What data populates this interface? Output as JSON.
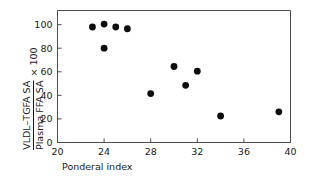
{
  "chart_data": {
    "type": "scatter",
    "title": "",
    "xlabel": "Ponderal index",
    "ylabel_numerator": "VLDL–TGFA SA",
    "ylabel_denominator": "Plasma FFA SA",
    "ylabel_suffix": "× 100",
    "xlim": [
      20,
      40
    ],
    "ylim": [
      0,
      112
    ],
    "xticks": [
      20,
      24,
      28,
      32,
      36,
      40
    ],
    "yticks": [
      0,
      20,
      40,
      60,
      80,
      100
    ],
    "xticklabels": [
      "20",
      "24",
      "28",
      "32",
      "36",
      "40"
    ],
    "yticklabels": [
      "0",
      "20",
      "40",
      "60",
      "80",
      "100"
    ],
    "grid": false,
    "legend": false,
    "marker_color": "#0d0d0d",
    "axis_color": "#4a4a4a",
    "points": [
      {
        "x": 23.0,
        "y": 98.0
      },
      {
        "x": 24.0,
        "y": 100.5
      },
      {
        "x": 25.0,
        "y": 98.0
      },
      {
        "x": 26.0,
        "y": 96.5
      },
      {
        "x": 24.0,
        "y": 80.0
      },
      {
        "x": 28.0,
        "y": 41.5
      },
      {
        "x": 30.0,
        "y": 64.5
      },
      {
        "x": 31.0,
        "y": 48.5
      },
      {
        "x": 32.0,
        "y": 60.5
      },
      {
        "x": 34.0,
        "y": 22.5
      },
      {
        "x": 39.0,
        "y": 26.0
      }
    ]
  }
}
